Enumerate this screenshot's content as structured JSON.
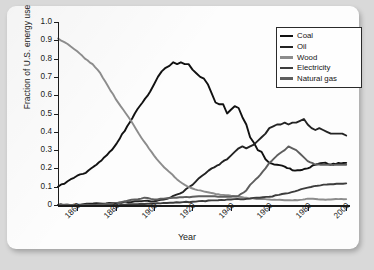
{
  "figure": {
    "background_color": "#d9d9d9",
    "card_color": "#fdfdfd"
  },
  "chart_data": {
    "type": "line",
    "title": "",
    "xlabel": "Year",
    "ylabel": "Fraction of U.S. energy use",
    "xlim": [
      1850,
      2002
    ],
    "ylim": [
      0,
      1.0
    ],
    "grid": false,
    "legend_position": "top-right",
    "x_ticks": [
      1860,
      1880,
      1900,
      1920,
      1940,
      1960,
      1980,
      2000
    ],
    "x_tick_labels": [
      "1860",
      "1880",
      "1900",
      "1920",
      "1940",
      "1960",
      "1980",
      "2000"
    ],
    "y_ticks": [
      0,
      0.1,
      0.2,
      0.3,
      0.4,
      0.5,
      0.6,
      0.7,
      0.8,
      0.9,
      1.0
    ],
    "y_tick_labels": [
      "0",
      "0.1",
      "0.2",
      "0.3",
      "0.4",
      "0.5",
      "0.6",
      "0.7",
      "0.8",
      "0.9",
      "1.0"
    ],
    "series": [
      {
        "name": "Coal",
        "color": "#111111",
        "width": 1.9,
        "x": [
          1850,
          1855,
          1860,
          1863,
          1866,
          1870,
          1874,
          1878,
          1882,
          1886,
          1890,
          1894,
          1898,
          1900,
          1902,
          1904,
          1906,
          1908,
          1910,
          1912,
          1914,
          1916,
          1918,
          1920,
          1922,
          1924,
          1926,
          1928,
          1930,
          1932,
          1934,
          1936,
          1938,
          1940,
          1942,
          1944,
          1946,
          1948,
          1950,
          1952,
          1954,
          1956,
          1958,
          1960,
          1964,
          1968,
          1972,
          1976,
          1980,
          1984,
          1988,
          1992,
          1996,
          2000
        ],
        "y": [
          0.1,
          0.13,
          0.16,
          0.17,
          0.19,
          0.22,
          0.26,
          0.3,
          0.36,
          0.43,
          0.5,
          0.56,
          0.62,
          0.66,
          0.7,
          0.73,
          0.75,
          0.76,
          0.78,
          0.77,
          0.78,
          0.77,
          0.77,
          0.74,
          0.72,
          0.7,
          0.69,
          0.66,
          0.61,
          0.56,
          0.55,
          0.55,
          0.5,
          0.52,
          0.54,
          0.53,
          0.48,
          0.44,
          0.37,
          0.34,
          0.3,
          0.29,
          0.25,
          0.23,
          0.22,
          0.21,
          0.19,
          0.19,
          0.2,
          0.22,
          0.23,
          0.22,
          0.23,
          0.23
        ]
      },
      {
        "name": "Oil",
        "color": "#232323",
        "width": 1.9,
        "x": [
          1850,
          1860,
          1870,
          1880,
          1890,
          1900,
          1905,
          1910,
          1915,
          1920,
          1925,
          1930,
          1934,
          1938,
          1940,
          1942,
          1944,
          1946,
          1948,
          1950,
          1952,
          1954,
          1956,
          1958,
          1960,
          1962,
          1964,
          1966,
          1968,
          1970,
          1972,
          1974,
          1976,
          1978,
          1980,
          1982,
          1984,
          1986,
          1988,
          1990,
          1992,
          1994,
          1996,
          1998,
          2000
        ],
        "y": [
          0.0,
          0.0,
          0.01,
          0.01,
          0.02,
          0.02,
          0.03,
          0.05,
          0.07,
          0.11,
          0.16,
          0.2,
          0.22,
          0.25,
          0.27,
          0.29,
          0.31,
          0.32,
          0.31,
          0.32,
          0.33,
          0.35,
          0.37,
          0.39,
          0.42,
          0.43,
          0.44,
          0.44,
          0.45,
          0.44,
          0.45,
          0.45,
          0.46,
          0.47,
          0.44,
          0.42,
          0.41,
          0.42,
          0.41,
          0.4,
          0.39,
          0.39,
          0.39,
          0.39,
          0.38
        ]
      },
      {
        "name": "Wood",
        "color": "#8c8c8c",
        "width": 1.9,
        "x": [
          1850,
          1855,
          1860,
          1864,
          1868,
          1872,
          1876,
          1880,
          1884,
          1888,
          1892,
          1896,
          1900,
          1904,
          1908,
          1912,
          1916,
          1920,
          1924,
          1928,
          1932,
          1936,
          1940,
          1944,
          1948,
          1952,
          1956,
          1960,
          1964,
          1968,
          1972,
          1976,
          1980,
          1984,
          1988,
          1992,
          1996,
          2000
        ],
        "y": [
          0.91,
          0.88,
          0.84,
          0.8,
          0.77,
          0.72,
          0.65,
          0.58,
          0.52,
          0.46,
          0.39,
          0.33,
          0.27,
          0.22,
          0.18,
          0.14,
          0.11,
          0.09,
          0.08,
          0.07,
          0.06,
          0.055,
          0.05,
          0.045,
          0.04,
          0.035,
          0.033,
          0.03,
          0.028,
          0.026,
          0.025,
          0.028,
          0.035,
          0.033,
          0.03,
          0.03,
          0.032,
          0.032
        ]
      },
      {
        "name": "Electricity",
        "color": "#3d3d3d",
        "width": 1.9,
        "x": [
          1850,
          1880,
          1890,
          1900,
          1910,
          1920,
          1930,
          1940,
          1950,
          1955,
          1960,
          1965,
          1970,
          1975,
          1980,
          1985,
          1990,
          1995,
          2000
        ],
        "y": [
          0.0,
          0.0,
          0.005,
          0.008,
          0.012,
          0.018,
          0.025,
          0.03,
          0.035,
          0.04,
          0.045,
          0.055,
          0.065,
          0.08,
          0.095,
          0.105,
          0.112,
          0.116,
          0.118
        ]
      },
      {
        "name": "Natural gas",
        "color": "#5e5e5e",
        "width": 1.9,
        "x": [
          1850,
          1870,
          1880,
          1885,
          1890,
          1895,
          1900,
          1905,
          1910,
          1915,
          1920,
          1925,
          1930,
          1935,
          1940,
          1944,
          1948,
          1950,
          1954,
          1958,
          1960,
          1964,
          1968,
          1970,
          1972,
          1974,
          1976,
          1978,
          1980,
          1984,
          1988,
          1992,
          1996,
          2000
        ],
        "y": [
          0.0,
          0.0,
          0.01,
          0.02,
          0.03,
          0.04,
          0.03,
          0.035,
          0.04,
          0.042,
          0.045,
          0.048,
          0.048,
          0.045,
          0.045,
          0.05,
          0.08,
          0.11,
          0.15,
          0.2,
          0.23,
          0.27,
          0.3,
          0.32,
          0.31,
          0.3,
          0.28,
          0.26,
          0.24,
          0.22,
          0.22,
          0.22,
          0.22,
          0.22
        ]
      }
    ]
  }
}
